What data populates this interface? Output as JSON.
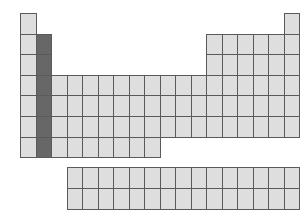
{
  "diagram": {
    "type": "periodic-table-outline",
    "highlighted_group": 2,
    "highlighted_periods": [
      2,
      3,
      4,
      5,
      6,
      7
    ],
    "colors": {
      "cell_fill": "#dedede",
      "cell_border": "#5a5a5a",
      "highlight_fill": "#676767",
      "background": "#ffffff"
    },
    "main_table": {
      "origin": [
        20,
        13
      ],
      "cell_width": 15.5,
      "cell_height": 20.6,
      "rows": [
        {
          "period": 1,
          "groups": [
            1,
            18
          ]
        },
        {
          "period": 2,
          "groups": [
            1,
            2,
            13,
            14,
            15,
            16,
            17,
            18
          ]
        },
        {
          "period": 3,
          "groups": [
            1,
            2,
            13,
            14,
            15,
            16,
            17,
            18
          ]
        },
        {
          "period": 4,
          "groups": [
            1,
            2,
            3,
            4,
            5,
            6,
            7,
            8,
            9,
            10,
            11,
            12,
            13,
            14,
            15,
            16,
            17,
            18
          ]
        },
        {
          "period": 5,
          "groups": [
            1,
            2,
            3,
            4,
            5,
            6,
            7,
            8,
            9,
            10,
            11,
            12,
            13,
            14,
            15,
            16,
            17,
            18
          ]
        },
        {
          "period": 6,
          "groups": [
            1,
            2,
            3,
            4,
            5,
            6,
            7,
            8,
            9,
            10,
            11,
            12,
            13,
            14,
            15,
            16,
            17,
            18
          ]
        },
        {
          "period": 7,
          "groups": [
            1,
            2,
            3,
            4,
            5,
            6,
            7,
            8,
            9
          ]
        }
      ]
    },
    "f_block": {
      "origin": [
        67,
        167
      ],
      "cell_width": 15.47,
      "cell_height": 21,
      "rows": 2,
      "columns": 15
    }
  }
}
